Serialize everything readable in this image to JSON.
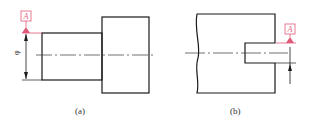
{
  "figure": {
    "panels": [
      {
        "id": "a",
        "caption": "(a)",
        "datum_label": "A",
        "dimension_symbol": "φ"
      },
      {
        "id": "b",
        "caption": "(b)",
        "datum_label": "A"
      }
    ],
    "colors": {
      "outline": "#1a1a1a",
      "datum": "#e05a78",
      "centerline": "#333333"
    }
  }
}
